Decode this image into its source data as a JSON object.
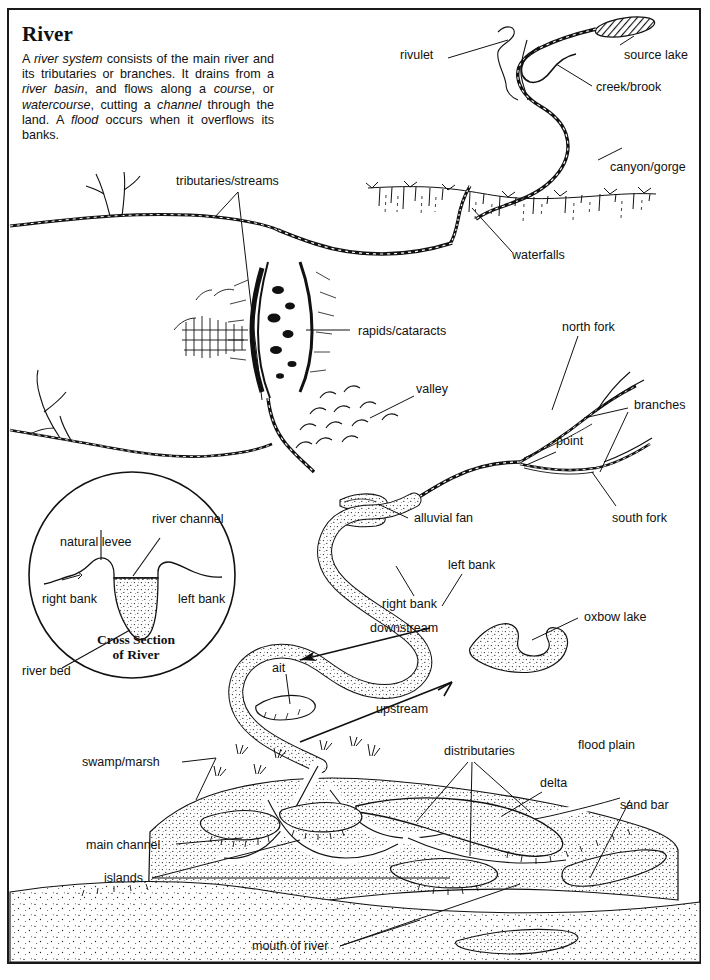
{
  "page": {
    "background": "#ffffff",
    "ink": "#111111",
    "frame_color": "#1a1a1a",
    "width": 710,
    "height": 980
  },
  "article": {
    "title": "River",
    "body_plain": "A river system consists of the main river and its tributaries or branches. It drains from a river basin, and flows along a course, or watercourse, cutting a channel through the land. A flood occurs when it overflows its banks.",
    "italic_terms": [
      "river system",
      "river basin",
      "course",
      "watercourse",
      "channel",
      "flood"
    ]
  },
  "inset": {
    "title_line1": "Cross Section",
    "title_line2": "of River",
    "labels": [
      {
        "id": "natural-levee",
        "text": "natural levee"
      },
      {
        "id": "river-channel",
        "text": "river channel"
      },
      {
        "id": "right-bank",
        "text": "right bank"
      },
      {
        "id": "left-bank",
        "text": "left bank"
      },
      {
        "id": "river-bed",
        "text": "river bed"
      }
    ]
  },
  "labels": {
    "rivulet": "rivulet",
    "source_lake": "source lake",
    "creek_brook": "creek/brook",
    "canyon_gorge": "canyon/gorge",
    "tributaries_streams": "tributaries/streams",
    "waterfalls": "waterfalls",
    "rapids_cataracts": "rapids/cataracts",
    "valley": "valley",
    "north_fork": "north fork",
    "branches": "branches",
    "point": "point",
    "south_fork": "south fork",
    "alluvial_fan": "alluvial fan",
    "left_bank": "left bank",
    "right_bank": "right bank",
    "downstream": "downstream",
    "oxbow_lake": "oxbow lake",
    "upstream": "upstream",
    "ait": "ait",
    "swamp_marsh": "swamp/marsh",
    "distributaries": "distributaries",
    "flood_plain": "flood plain",
    "delta": "delta",
    "sand_bar": "sand bar",
    "main_channel": "main channel",
    "islands": "islands",
    "mouth_of_river": "mouth of river"
  },
  "diagram_features": [
    "source lake (hatched ellipse, top right)",
    "rivulet headwater squiggle",
    "creek/brook tributary",
    "canyon/gorge descent",
    "waterfalls over escarpment",
    "rapids/cataracts at bluff",
    "tributaries/streams entering from left",
    "valley with hill hatching",
    "north fork, south fork, branches, point",
    "alluvial fan",
    "meandering channel with left/right banks",
    "downstream and upstream flow arrows",
    "oxbow lake",
    "ait (island in channel)",
    "swamp/marsh grass tufts",
    "distributaries fanning into delta",
    "flood plain",
    "delta lobes and sand bar",
    "main channel, islands",
    "mouth of river opening to stippled sea"
  ]
}
